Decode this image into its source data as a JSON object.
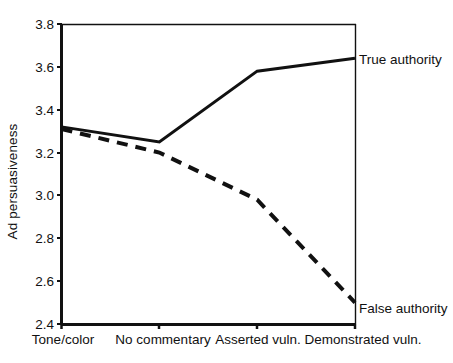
{
  "chart_data": {
    "type": "line",
    "title": "",
    "xlabel": "",
    "ylabel": "Ad persuasiveness",
    "categories": [
      "Tone/color",
      "No commentary",
      "Asserted vuln.",
      "Demonstrated vuln."
    ],
    "ylim": [
      2.4,
      3.8
    ],
    "yticks": [
      2.4,
      2.6,
      2.8,
      3.0,
      3.2,
      3.4,
      3.6,
      3.8
    ],
    "ytick_labels": [
      "2.4",
      "2.6",
      "2.8",
      "3.0",
      "3.2",
      "3.4",
      "3.6",
      "3.8"
    ],
    "grid": false,
    "legend_position": "right-inline-end-labels",
    "series": [
      {
        "name": "True authority",
        "style": "solid",
        "color": "#111111",
        "values": [
          3.32,
          3.25,
          3.58,
          3.64
        ]
      },
      {
        "name": "False authority",
        "style": "dashed",
        "color": "#111111",
        "values": [
          3.31,
          3.2,
          2.98,
          2.5
        ]
      }
    ],
    "annotations": [
      {
        "text": "True authority",
        "series": "True authority",
        "at_category": "Demonstrated vuln."
      },
      {
        "text": "False authority",
        "series": "False authority",
        "at_category": "Demonstrated vuln."
      }
    ]
  },
  "axes": {
    "y_title": "Ad persuasiveness"
  }
}
